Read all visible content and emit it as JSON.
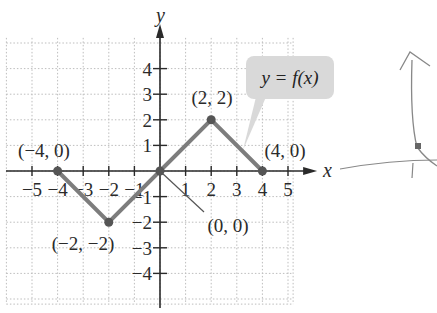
{
  "chart_data": {
    "type": "line",
    "title": "",
    "xlabel": "x",
    "ylabel": "y",
    "xlim": [
      -6,
      5.2
    ],
    "ylim": [
      -5.2,
      5.2
    ],
    "grid": true,
    "x_ticks": [
      -5,
      -4,
      -3,
      -2,
      -1,
      1,
      2,
      3,
      4,
      5
    ],
    "y_ticks": [
      -4,
      -3,
      -2,
      -1,
      1,
      2,
      3,
      4
    ],
    "x_tick_labels": [
      "−5",
      "−4",
      "−3",
      "−2",
      "−1",
      "1",
      "2",
      "3",
      "4",
      "5"
    ],
    "y_tick_labels": [
      "−4",
      "−3",
      "−2",
      "−1",
      "1",
      "2",
      "3",
      "4"
    ],
    "series": [
      {
        "name": "y = f(x)",
        "x": [
          -4,
          -2,
          0,
          2,
          4
        ],
        "y": [
          0,
          -2,
          0,
          2,
          0
        ]
      }
    ],
    "annotations": [
      {
        "text": "(−4, 0)",
        "x": -4,
        "y": 0
      },
      {
        "text": "(−2, −2)",
        "x": -2,
        "y": -2
      },
      {
        "text": "(0, 0)",
        "x": 0,
        "y": 0
      },
      {
        "text": "(2, 2)",
        "x": 2,
        "y": 2
      },
      {
        "text": "(4, 0)",
        "x": 4,
        "y": 0
      }
    ],
    "callout": {
      "text": "y = f(x)"
    },
    "colors": {
      "line": "#7d7d7d",
      "axis": "#2a2a2a",
      "grid": "#bdbdbd",
      "callout_bg": "#d9d9d9",
      "point": "#555555"
    }
  }
}
